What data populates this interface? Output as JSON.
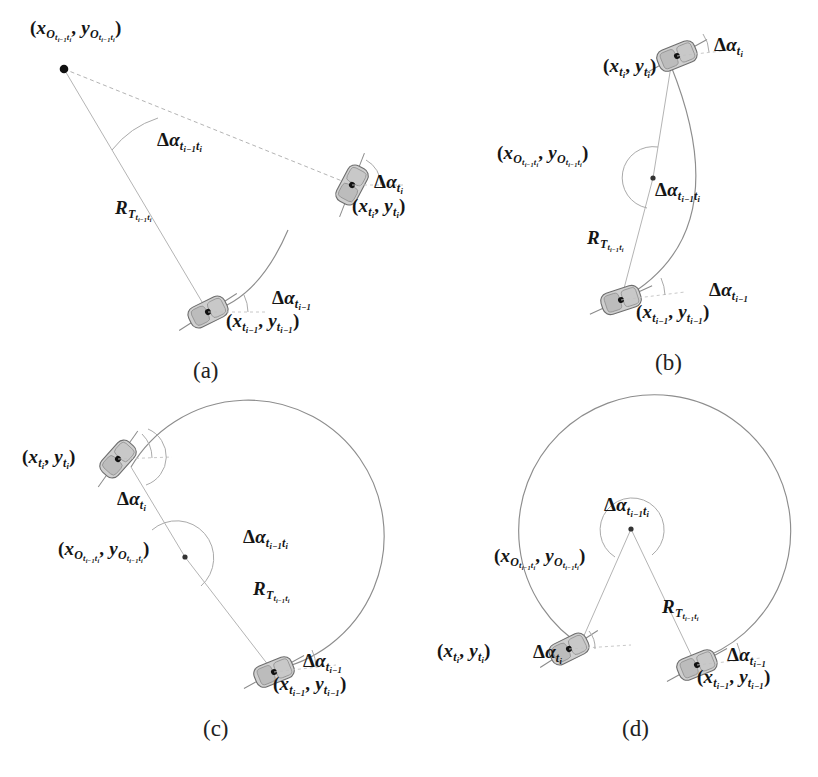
{
  "figure": {
    "background_color": "#ffffff",
    "line_color": "#8d8d8d",
    "text_color": "#151515",
    "panel_count": 4
  },
  "symbols": {
    "center_label": "(xO_{t_{i-1}t_i}, yO_{t_{i-1}t_i})",
    "radius_label": "R_{T_{t_{i-1}t_i}}",
    "turn_angle_label": "Δα_{t_{i-1}t_i}",
    "heading_prev_label": "Δα_{t_{i-1}}",
    "heading_cur_label": "Δα_{t_i}",
    "pos_prev_label": "(x_{t_{i-1}}, y_{t_{i-1}})",
    "pos_cur_label": "(x_{t_i}, y_{t_i})",
    "delta": "Δ",
    "alpha": "α",
    "open_paren": "(",
    "close_paren": ")",
    "comma": ",",
    "x": "x",
    "y": "y",
    "O": "O",
    "R": "R",
    "T": "T",
    "t": "t",
    "i": "i",
    "i_minus_1": "i−1"
  },
  "panels": [
    {
      "id": "a",
      "caption": "(a)",
      "description": "Small turn angle, long turn radius; center of rotation far from trajectory",
      "turn_angle_deg": 38,
      "arc_span": "small",
      "labels": {
        "center": "(xO_{t_{i-1}t_i}, yO_{t_{i-1}t_i})",
        "radius": "R_{T_{t_{i-1}t_i}}",
        "turn_angle": "Δα_{t_{i-1}t_i}",
        "heading_prev": "Δα_{t_{i-1}}",
        "heading_cur": "Δα_{t_i}",
        "pos_prev": "(x_{t_{i-1}}, y_{t_{i-1}})",
        "pos_cur": "(x_{t_i}, y_{t_i})"
      }
    },
    {
      "id": "b",
      "caption": "(b)",
      "description": "Medium turn angle, medium turn radius; center of rotation near the chord",
      "turn_angle_deg": 110,
      "arc_span": "medium",
      "labels": {
        "center": "(xO_{t_{i-1}t_i}, yO_{t_{i-1}t_i})",
        "radius": "R_{T_{t_{i-1}t_i}}",
        "turn_angle": "Δα_{t_{i-1}t_i}",
        "heading_prev": "Δα_{t_{i-1}}",
        "heading_cur": "Δα_{t_i}",
        "pos_prev": "(x_{t_{i-1}}, y_{t_{i-1}})",
        "pos_cur": "(x_{t_i}, y_{t_i})"
      }
    },
    {
      "id": "c",
      "caption": "(c)",
      "description": "Large reflex turn angle, short turn radius; arc sweeps more than half a circle",
      "turn_angle_deg": 230,
      "arc_span": "large-reflex",
      "labels": {
        "center": "(xO_{t_{i-1}t_i}, yO_{t_{i-1}t_i})",
        "radius": "R_{T_{t_{i-1}t_i}}",
        "turn_angle": "Δα_{t_{i-1}t_i}",
        "heading_prev": "Δα_{t_{i-1}}",
        "heading_cur": "Δα_{t_i}",
        "pos_prev": "(x_{t_{i-1}}, y_{t_{i-1}})",
        "pos_cur": "(x_{t_i}, y_{t_i})"
      }
    },
    {
      "id": "d",
      "caption": "(d)",
      "description": "Near full-circle turn angle, shortest turn radius; arc almost closes on itself",
      "turn_angle_deg": 300,
      "arc_span": "near-full-circle",
      "labels": {
        "center": "(xO_{t_{i-1}t_i}, yO_{t_{i-1}t_i})",
        "radius": "R_{T_{t_{i-1}t_i}}",
        "turn_angle": "Δα_{t_{i-1}t_i}",
        "heading_prev": "Δα_{t_{i-1}}",
        "heading_cur": "Δα_{t_i}",
        "pos_prev": "(x_{t_{i-1}}, y_{t_{i-1}})",
        "pos_cur": "(x_{t_i}, y_{t_i})"
      }
    }
  ]
}
